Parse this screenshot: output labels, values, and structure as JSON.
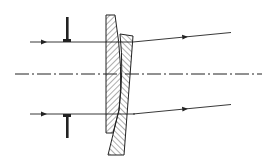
{
  "diagram": {
    "type": "optics-schematic",
    "colors": {
      "background": "#ffffff",
      "stroke": "#222222",
      "hatch": "#333333"
    },
    "elements": {
      "optical_axis": {
        "y": 74,
        "x_start": 15,
        "x_end": 262,
        "style": "dash-dot"
      },
      "upper_ray": {
        "in": [
          [
            30,
            42
          ],
          [
            106,
            42
          ]
        ],
        "out": [
          [
            133,
            42
          ],
          [
            230,
            33
          ]
        ]
      },
      "lower_ray": {
        "in": [
          [
            30,
            114
          ],
          [
            106,
            114
          ]
        ],
        "out": [
          [
            133,
            114
          ],
          [
            230,
            104
          ]
        ]
      },
      "upper_stop": {
        "x": 67,
        "y_top": 17,
        "y_bottom": 42
      },
      "lower_stop": {
        "x": 67,
        "y_top": 114,
        "y_bottom": 138
      },
      "left_prism": "hatched wedge, flat left face",
      "right_prism": "hatched wedge, angled right face"
    }
  }
}
